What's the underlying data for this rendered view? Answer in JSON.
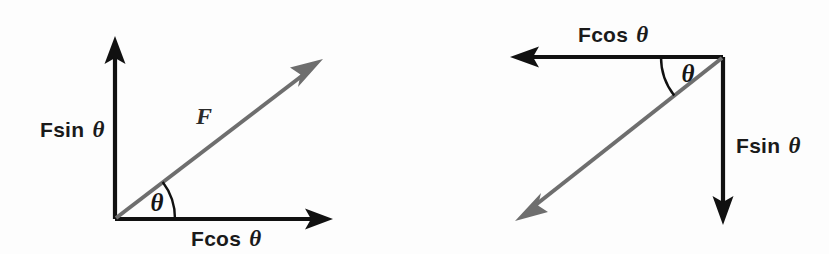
{
  "figure": {
    "background_color": "#fdfdfd",
    "axis_color": "#111111",
    "resultant_color": "#6e6e6e",
    "text_color": "#1a1a1a",
    "width": 829,
    "height": 254
  },
  "left_diagram": {
    "name": "force-resolved-first-quadrant",
    "origin": {
      "x": 115,
      "y": 219
    },
    "vertical_axis_label": "Fsin",
    "vertical_axis_symbol": "θ",
    "horizontal_axis_label": "Fcos",
    "horizontal_axis_symbol": "θ",
    "resultant_label": "F",
    "angle_label": "θ",
    "vertical_axis_tip": {
      "x": 115,
      "y": 40
    },
    "horizontal_axis_tip": {
      "x": 331,
      "y": 219
    },
    "resultant_tip": {
      "x": 322,
      "y": 60
    },
    "angle_degrees": 38,
    "arc_radius": 60
  },
  "right_diagram": {
    "name": "force-resolved-third-quadrant",
    "vertex": {
      "x": 723,
      "y": 57
    },
    "horizontal_axis_label": "Fcos",
    "horizontal_axis_symbol": "θ",
    "vertical_axis_label": "Fsin",
    "vertical_axis_symbol": "θ",
    "angle_label": "θ",
    "horizontal_axis_tip": {
      "x": 512,
      "y": 57
    },
    "vertical_axis_tip": {
      "x": 723,
      "y": 223
    },
    "resultant_tip": {
      "x": 516,
      "y": 219
    },
    "angle_degrees": 38,
    "arc_radius": 62
  }
}
